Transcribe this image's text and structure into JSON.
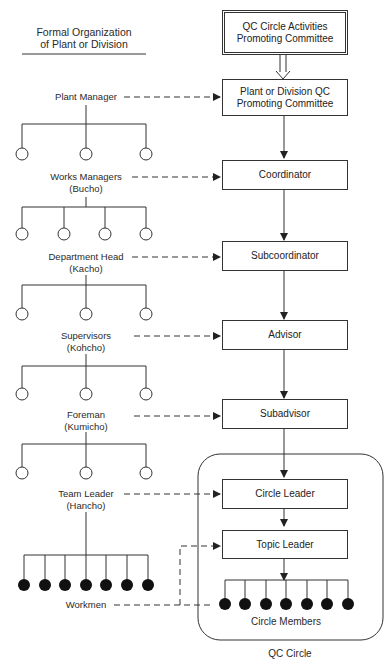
{
  "formal_org": {
    "title_line1": "Formal Organization",
    "title_line2": "of Plant or Division",
    "levels": [
      {
        "name": "Plant Manager",
        "sub": "",
        "children": 3,
        "filled": false
      },
      {
        "name": "Works Managers",
        "sub": "(Bucho)",
        "children": 4,
        "filled": false
      },
      {
        "name": "Department Head",
        "sub": "(Kacho)",
        "children": 3,
        "filled": false
      },
      {
        "name": "Supervisors",
        "sub": "(Kohcho)",
        "children": 3,
        "filled": false
      },
      {
        "name": "Foreman",
        "sub": "(Kumicho)",
        "children": 3,
        "filled": false
      },
      {
        "name": "Team Leader",
        "sub": "(Hancho)",
        "children": 7,
        "filled": true
      }
    ],
    "workmen": "Workmen"
  },
  "qc_org": {
    "top": {
      "line1": "QC Circle Activities",
      "line2": "Promoting Committee"
    },
    "plant_committee": {
      "line1": "Plant or Division QC",
      "line2": "Promoting Committee"
    },
    "coordinator": "Coordinator",
    "subcoordinator": "Subcoordinator",
    "advisor": "Advisor",
    "subadvisor": "Subadvisor",
    "circle_leader": "Circle Leader",
    "topic_leader": "Topic Leader",
    "circle_members": "Circle Members",
    "circle_member_count": 7,
    "qc_circle_label": "QC Circle"
  }
}
